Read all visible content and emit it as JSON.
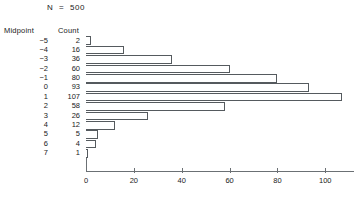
{
  "header": {
    "n_label": "N  =  500"
  },
  "table": {
    "headers": {
      "midpoint": "Midpoint",
      "count": "Count"
    }
  },
  "chart_data": {
    "type": "bar",
    "orientation": "horizontal",
    "title": "N  =  500",
    "xlabel": "",
    "ylabel": "Midpoint",
    "categories": [
      "−5",
      "−4",
      "−3",
      "−2",
      "−1",
      "0",
      "1",
      "2",
      "3",
      "4",
      "5",
      "6",
      "7"
    ],
    "values": [
      2,
      16,
      36,
      60,
      80,
      93,
      107,
      58,
      26,
      12,
      5,
      4,
      1
    ],
    "value_labels": [
      "2",
      "16",
      "36",
      "60",
      "80",
      "93",
      "107",
      "58",
      "26",
      "12",
      "5",
      "4",
      "1"
    ],
    "total": 500,
    "xlim": [
      0,
      112
    ],
    "xticks": [
      0,
      20,
      40,
      60,
      80,
      100
    ],
    "xtick_labels": [
      "0",
      "20",
      "40",
      "60",
      "80",
      "100"
    ],
    "grid": false,
    "legend": null,
    "bar_fill": "#ffffff",
    "bar_edge": "#555a5e",
    "axis_color": "#6b7074"
  }
}
